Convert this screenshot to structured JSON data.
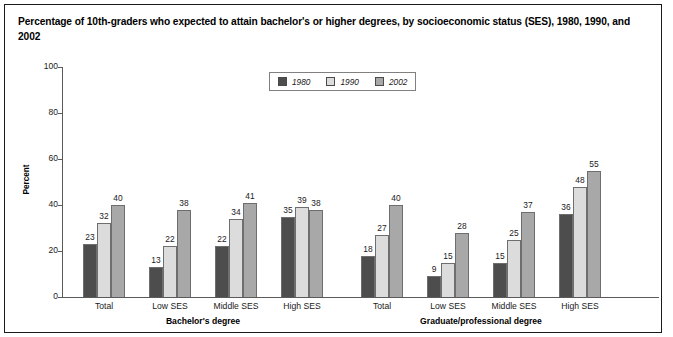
{
  "title": "Percentage of 10th-graders who expected to attain bachelor's or higher degrees, by socioeconomic status (SES), 1980, 1990, and 2002",
  "chart_data": {
    "type": "bar",
    "title": "Percentage of 10th-graders who expected to attain bachelor's or higher degrees, by socioeconomic status (SES), 1980, 1990, and 2002",
    "xlabel": "",
    "ylabel": "Percent",
    "ylim": [
      0,
      100
    ],
    "yticks": [
      "0",
      "20",
      "40",
      "60",
      "80",
      "100"
    ],
    "grid": false,
    "legend_position": "top-center",
    "legend": [
      "1980",
      "1990",
      "2002"
    ],
    "series_colors": [
      "#4d4d4d",
      "#dcdcdc",
      "#a8a8a8"
    ],
    "sections": [
      {
        "label": "Bachelor's degree",
        "categories": [
          "Total",
          "Low SES",
          "Middle SES",
          "High SES"
        ],
        "series": [
          {
            "name": "1980",
            "values": [
              23,
              13,
              22,
              35
            ]
          },
          {
            "name": "1990",
            "values": [
              32,
              22,
              34,
              39
            ]
          },
          {
            "name": "2002",
            "values": [
              40,
              38,
              41,
              38
            ]
          }
        ]
      },
      {
        "label": "Graduate/professional degree",
        "categories": [
          "Total",
          "Low SES",
          "Middle SES",
          "High SES"
        ],
        "series": [
          {
            "name": "1980",
            "values": [
              18,
              9,
              15,
              36
            ]
          },
          {
            "name": "1990",
            "values": [
              27,
              15,
              25,
              48
            ]
          },
          {
            "name": "2002",
            "values": [
              40,
              28,
              37,
              55
            ]
          }
        ]
      }
    ]
  }
}
